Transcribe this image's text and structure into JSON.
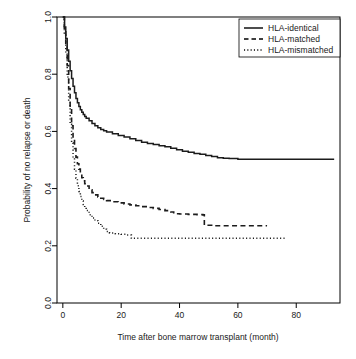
{
  "chart_data": {
    "type": "line",
    "title": "",
    "xlabel": "Time after bone marrow transplant (month)",
    "ylabel": "Probability of no relapse or death",
    "xlim": [
      -2,
      95
    ],
    "ylim": [
      0.0,
      1.0
    ],
    "xticks": [
      0,
      20,
      40,
      60,
      80
    ],
    "xtick_labels": [
      "0",
      "20",
      "40",
      "60",
      "80"
    ],
    "yticks": [
      0.0,
      0.2,
      0.4,
      0.6,
      0.8,
      1.0
    ],
    "ytick_labels": [
      "0.0",
      "0.2",
      "0.4",
      "0.6",
      "0.8",
      "1.0"
    ],
    "grid": false,
    "legend_position": "top-right",
    "step": "post",
    "series": [
      {
        "name": "HLA-identical",
        "style": "solid",
        "color": "#1c1c1c",
        "points": [
          [
            0.0,
            1.0
          ],
          [
            0.6,
            0.965
          ],
          [
            1.0,
            0.925
          ],
          [
            1.5,
            0.885
          ],
          [
            2.0,
            0.845
          ],
          [
            2.5,
            0.812
          ],
          [
            3.0,
            0.785
          ],
          [
            3.5,
            0.758
          ],
          [
            4.0,
            0.735
          ],
          [
            4.5,
            0.715
          ],
          [
            5.0,
            0.7
          ],
          [
            5.5,
            0.687
          ],
          [
            6.0,
            0.676
          ],
          [
            6.5,
            0.667
          ],
          [
            7.0,
            0.659
          ],
          [
            7.5,
            0.652
          ],
          [
            8.0,
            0.646
          ],
          [
            9.0,
            0.637
          ],
          [
            10.0,
            0.628
          ],
          [
            11.0,
            0.62
          ],
          [
            12.0,
            0.613
          ],
          [
            13.0,
            0.607
          ],
          [
            14.0,
            0.602
          ],
          [
            15.0,
            0.598
          ],
          [
            17.0,
            0.592
          ],
          [
            19.0,
            0.586
          ],
          [
            21.0,
            0.58
          ],
          [
            23.0,
            0.574
          ],
          [
            25.0,
            0.568
          ],
          [
            27.0,
            0.562
          ],
          [
            29.0,
            0.558
          ],
          [
            31.0,
            0.554
          ],
          [
            33.0,
            0.55
          ],
          [
            35.0,
            0.546
          ],
          [
            37.0,
            0.541
          ],
          [
            39.0,
            0.536
          ],
          [
            41.0,
            0.531
          ],
          [
            43.0,
            0.527
          ],
          [
            45.0,
            0.523
          ],
          [
            47.0,
            0.52
          ],
          [
            49.0,
            0.516
          ],
          [
            51.0,
            0.512
          ],
          [
            53.0,
            0.508
          ],
          [
            55.0,
            0.506
          ],
          [
            57.0,
            0.505
          ],
          [
            60.0,
            0.503
          ],
          [
            70.0,
            0.503
          ],
          [
            80.0,
            0.503
          ],
          [
            93.0,
            0.503
          ]
        ]
      },
      {
        "name": "HLA-matched",
        "style": "dashed",
        "color": "#1c1c1c",
        "points": [
          [
            0.0,
            1.0
          ],
          [
            0.5,
            0.955
          ],
          [
            1.0,
            0.9
          ],
          [
            1.5,
            0.83
          ],
          [
            2.0,
            0.75
          ],
          [
            2.5,
            0.68
          ],
          [
            3.0,
            0.62
          ],
          [
            3.5,
            0.575
          ],
          [
            4.0,
            0.54
          ],
          [
            4.5,
            0.51
          ],
          [
            5.0,
            0.487
          ],
          [
            5.5,
            0.468
          ],
          [
            6.0,
            0.452
          ],
          [
            6.5,
            0.438
          ],
          [
            7.0,
            0.427
          ],
          [
            7.5,
            0.417
          ],
          [
            8.0,
            0.409
          ],
          [
            9.0,
            0.396
          ],
          [
            10.0,
            0.386
          ],
          [
            11.0,
            0.378
          ],
          [
            12.0,
            0.371
          ],
          [
            13.0,
            0.366
          ],
          [
            14.0,
            0.362
          ],
          [
            15.0,
            0.358
          ],
          [
            17.0,
            0.354
          ],
          [
            19.0,
            0.35
          ],
          [
            21.0,
            0.346
          ],
          [
            23.0,
            0.343
          ],
          [
            25.0,
            0.34
          ],
          [
            27.0,
            0.337
          ],
          [
            29.0,
            0.334
          ],
          [
            31.0,
            0.331
          ],
          [
            33.0,
            0.327
          ],
          [
            35.0,
            0.323
          ],
          [
            37.0,
            0.318
          ],
          [
            38.0,
            0.312
          ],
          [
            40.0,
            0.311
          ],
          [
            43.0,
            0.31
          ],
          [
            46.0,
            0.309
          ],
          [
            48.0,
            0.308
          ],
          [
            48.5,
            0.272
          ],
          [
            52.0,
            0.27
          ],
          [
            58.0,
            0.27
          ],
          [
            64.0,
            0.27
          ],
          [
            70.0,
            0.27
          ]
        ]
      },
      {
        "name": "HLA-mismatched",
        "style": "dotted",
        "color": "#1c1c1c",
        "points": [
          [
            0.0,
            1.0
          ],
          [
            0.5,
            0.94
          ],
          [
            1.0,
            0.87
          ],
          [
            1.5,
            0.79
          ],
          [
            2.0,
            0.705
          ],
          [
            2.5,
            0.625
          ],
          [
            3.0,
            0.56
          ],
          [
            3.5,
            0.508
          ],
          [
            4.0,
            0.468
          ],
          [
            4.5,
            0.436
          ],
          [
            5.0,
            0.41
          ],
          [
            5.5,
            0.39
          ],
          [
            6.0,
            0.372
          ],
          [
            6.5,
            0.357
          ],
          [
            7.0,
            0.344
          ],
          [
            7.5,
            0.333
          ],
          [
            8.0,
            0.323
          ],
          [
            9.0,
            0.309
          ],
          [
            10.0,
            0.297
          ],
          [
            11.0,
            0.288
          ],
          [
            12.0,
            0.279
          ],
          [
            13.0,
            0.268
          ],
          [
            14.0,
            0.258
          ],
          [
            15.0,
            0.25
          ],
          [
            16.0,
            0.245
          ],
          [
            18.0,
            0.242
          ],
          [
            20.0,
            0.24
          ],
          [
            22.0,
            0.238
          ],
          [
            23.5,
            0.226
          ],
          [
            30.0,
            0.226
          ],
          [
            40.0,
            0.226
          ],
          [
            50.0,
            0.226
          ],
          [
            60.0,
            0.226
          ],
          [
            70.0,
            0.226
          ],
          [
            76.0,
            0.226
          ]
        ]
      }
    ],
    "legend": [
      {
        "label": "HLA-identical",
        "style": "solid"
      },
      {
        "label": "HLA-matched",
        "style": "dashed"
      },
      {
        "label": "HLA-mismatched",
        "style": "dotted"
      }
    ]
  }
}
